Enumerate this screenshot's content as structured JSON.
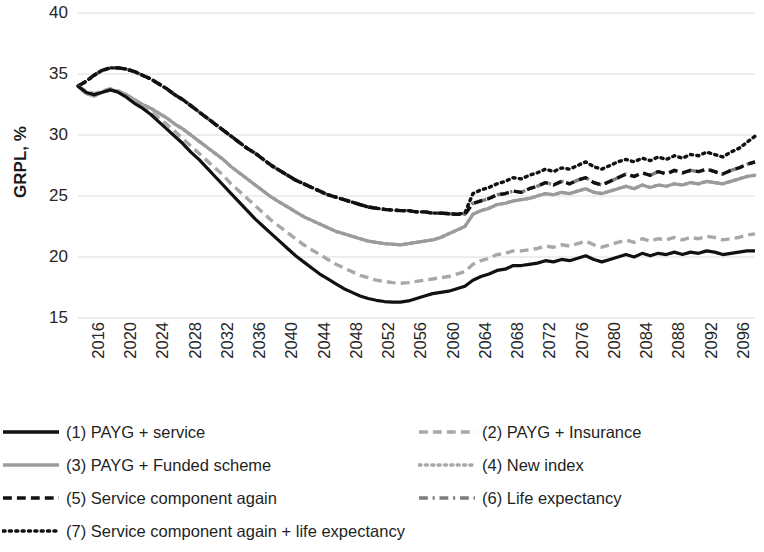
{
  "chart": {
    "type": "line",
    "ylabel": "GRPL, %",
    "xlabel": ""
  },
  "axis": {
    "y_ticks": [
      "40",
      "35",
      "30",
      "25",
      "20",
      "15"
    ],
    "x_ticks": [
      "2016",
      "2020",
      "2024",
      "2028",
      "2032",
      "2036",
      "2040",
      "2044",
      "2048",
      "2052",
      "2056",
      "2060",
      "2064",
      "2068",
      "2072",
      "2076",
      "2080",
      "2084",
      "2088",
      "2092",
      "2096",
      "2100"
    ]
  },
  "legend": {
    "items": [
      {
        "id": "series-1",
        "label": "(1) PAYG + service",
        "style": "solid",
        "color": "#111111",
        "width": 3.4,
        "column": "left",
        "row": 0
      },
      {
        "id": "series-3",
        "label": "(3) PAYG + Funded scheme",
        "style": "solid",
        "color": "#9b9b9b",
        "width": 3.4,
        "column": "left",
        "row": 1
      },
      {
        "id": "series-5",
        "label": "(5) Service component again",
        "style": "dash",
        "color": "#111111",
        "width": 3.4,
        "column": "left",
        "row": 2
      },
      {
        "id": "series-7",
        "label": "(7) Service component again + life expectancy",
        "style": "dot",
        "color": "#111111",
        "width": 3.4,
        "column": "left",
        "row": 3
      },
      {
        "id": "series-2",
        "label": "(2) PAYG + Insurance",
        "style": "dash",
        "color": "#a8a8a8",
        "width": 3.4,
        "column": "right",
        "row": 0
      },
      {
        "id": "series-4",
        "label": "(4) New index",
        "style": "dot",
        "color": "#a8a8a8",
        "width": 3.4,
        "column": "right",
        "row": 1
      },
      {
        "id": "series-6",
        "label": "(6) Life expectancy",
        "style": "dashdot",
        "color": "#7d7d7d",
        "width": 3.4,
        "column": "right",
        "row": 2
      }
    ]
  },
  "chart_data": {
    "type": "line",
    "title": "",
    "xlabel": "",
    "ylabel": "GRPL, %",
    "ylim": [
      15,
      40
    ],
    "xlim": [
      2016,
      2100
    ],
    "grid": true,
    "legend_position": "bottom",
    "x": [
      2016,
      2017,
      2018,
      2019,
      2020,
      2021,
      2022,
      2023,
      2024,
      2025,
      2026,
      2027,
      2028,
      2029,
      2030,
      2031,
      2032,
      2033,
      2034,
      2035,
      2036,
      2037,
      2038,
      2039,
      2040,
      2041,
      2042,
      2043,
      2044,
      2045,
      2046,
      2047,
      2048,
      2049,
      2050,
      2051,
      2052,
      2053,
      2054,
      2055,
      2056,
      2057,
      2058,
      2059,
      2060,
      2061,
      2062,
      2063,
      2064,
      2065,
      2066,
      2067,
      2068,
      2069,
      2070,
      2071,
      2072,
      2073,
      2074,
      2075,
      2076,
      2077,
      2078,
      2079,
      2080,
      2081,
      2082,
      2083,
      2084,
      2085,
      2086,
      2087,
      2088,
      2089,
      2090,
      2091,
      2092,
      2093,
      2094,
      2095,
      2096,
      2097,
      2098,
      2099,
      2100
    ],
    "series": [
      {
        "name": "(1) PAYG + service",
        "style": "solid",
        "color": "#111111",
        "values": [
          34.0,
          33.5,
          33.3,
          33.5,
          33.7,
          33.5,
          33.1,
          32.6,
          32.2,
          31.7,
          31.1,
          30.5,
          29.9,
          29.3,
          28.6,
          28.0,
          27.3,
          26.6,
          25.9,
          25.2,
          24.5,
          23.8,
          23.1,
          22.5,
          21.9,
          21.3,
          20.7,
          20.1,
          19.6,
          19.1,
          18.6,
          18.2,
          17.8,
          17.4,
          17.1,
          16.8,
          16.6,
          16.45,
          16.35,
          16.3,
          16.3,
          16.4,
          16.6,
          16.8,
          17.0,
          17.1,
          17.2,
          17.4,
          17.6,
          18.1,
          18.4,
          18.6,
          18.9,
          19.0,
          19.3,
          19.3,
          19.4,
          19.5,
          19.7,
          19.6,
          19.8,
          19.7,
          19.9,
          20.1,
          19.8,
          19.6,
          19.8,
          20.0,
          20.2,
          20.0,
          20.3,
          20.1,
          20.3,
          20.2,
          20.4,
          20.2,
          20.4,
          20.3,
          20.5,
          20.4,
          20.2,
          20.3,
          20.4,
          20.5,
          20.5
        ]
      },
      {
        "name": "(2) PAYG + Insurance",
        "style": "dash",
        "color": "#a8a8a8",
        "values": [
          34.0,
          33.6,
          33.4,
          33.6,
          33.8,
          33.6,
          33.2,
          32.8,
          32.4,
          31.9,
          31.4,
          30.9,
          30.3,
          29.7,
          29.1,
          28.5,
          27.9,
          27.3,
          26.7,
          26.0,
          25.4,
          24.8,
          24.2,
          23.6,
          23.0,
          22.5,
          22.0,
          21.5,
          21.0,
          20.6,
          20.2,
          19.8,
          19.4,
          19.1,
          18.8,
          18.5,
          18.3,
          18.1,
          18.0,
          17.9,
          17.85,
          17.9,
          18.0,
          18.1,
          18.2,
          18.3,
          18.4,
          18.6,
          18.8,
          19.4,
          19.7,
          19.9,
          20.2,
          20.3,
          20.5,
          20.5,
          20.6,
          20.7,
          20.9,
          20.8,
          21.0,
          20.9,
          21.1,
          21.3,
          21.0,
          20.8,
          21.0,
          21.2,
          21.4,
          21.2,
          21.5,
          21.3,
          21.5,
          21.4,
          21.6,
          21.4,
          21.6,
          21.5,
          21.7,
          21.6,
          21.4,
          21.5,
          21.6,
          21.8,
          21.9
        ]
      },
      {
        "name": "(3) PAYG + Funded scheme",
        "style": "solid",
        "color": "#9b9b9b",
        "values": [
          34.0,
          33.4,
          33.2,
          33.5,
          33.7,
          33.6,
          33.3,
          32.9,
          32.5,
          32.2,
          31.8,
          31.4,
          30.9,
          30.5,
          30.0,
          29.5,
          29.0,
          28.5,
          28.0,
          27.4,
          26.9,
          26.4,
          25.9,
          25.4,
          24.9,
          24.5,
          24.1,
          23.7,
          23.3,
          23.0,
          22.7,
          22.4,
          22.1,
          21.9,
          21.7,
          21.5,
          21.3,
          21.2,
          21.1,
          21.05,
          21.0,
          21.1,
          21.2,
          21.3,
          21.4,
          21.6,
          21.9,
          22.2,
          22.5,
          23.5,
          23.8,
          24.0,
          24.3,
          24.4,
          24.6,
          24.7,
          24.8,
          25.0,
          25.2,
          25.1,
          25.3,
          25.2,
          25.4,
          25.6,
          25.3,
          25.2,
          25.4,
          25.6,
          25.8,
          25.6,
          25.9,
          25.7,
          25.9,
          25.8,
          26.0,
          25.9,
          26.1,
          26.0,
          26.2,
          26.1,
          26.0,
          26.2,
          26.4,
          26.6,
          26.7
        ]
      },
      {
        "name": "(4) New index",
        "style": "dot",
        "color": "#a8a8a8",
        "values": [
          34.0,
          33.4,
          33.2,
          33.5,
          33.7,
          33.6,
          33.3,
          32.9,
          32.5,
          32.2,
          31.8,
          31.4,
          30.9,
          30.5,
          30.0,
          29.5,
          29.0,
          28.5,
          28.0,
          27.4,
          26.9,
          26.4,
          25.9,
          25.4,
          24.9,
          24.5,
          24.1,
          23.7,
          23.3,
          23.0,
          22.7,
          22.4,
          22.1,
          21.9,
          21.7,
          21.5,
          21.3,
          21.2,
          21.1,
          21.05,
          21.0,
          21.1,
          21.2,
          21.3,
          21.4,
          21.6,
          21.9,
          22.2,
          22.5,
          23.5,
          23.8,
          24.0,
          24.3,
          24.4,
          24.6,
          24.7,
          24.8,
          25.0,
          25.2,
          25.1,
          25.3,
          25.2,
          25.4,
          25.6,
          25.3,
          25.2,
          25.4,
          25.6,
          25.8,
          25.6,
          25.9,
          25.7,
          25.9,
          25.8,
          26.0,
          25.9,
          26.1,
          26.0,
          26.2,
          26.1,
          26.0,
          26.2,
          26.4,
          26.6,
          26.7
        ]
      },
      {
        "name": "(5) Service component again",
        "style": "dash",
        "color": "#111111",
        "values": [
          34.0,
          34.4,
          34.9,
          35.3,
          35.5,
          35.5,
          35.4,
          35.2,
          34.9,
          34.6,
          34.2,
          33.8,
          33.3,
          32.9,
          32.4,
          31.9,
          31.4,
          30.9,
          30.4,
          29.9,
          29.4,
          28.9,
          28.5,
          28.0,
          27.5,
          27.1,
          26.7,
          26.3,
          26.0,
          25.7,
          25.4,
          25.1,
          24.9,
          24.7,
          24.5,
          24.3,
          24.1,
          24.0,
          23.9,
          23.85,
          23.8,
          23.8,
          23.7,
          23.7,
          23.6,
          23.6,
          23.55,
          23.5,
          23.5,
          24.4,
          24.6,
          24.8,
          25.1,
          25.2,
          25.4,
          25.3,
          25.6,
          25.8,
          26.1,
          25.9,
          26.2,
          26.0,
          26.3,
          26.5,
          26.1,
          25.9,
          26.2,
          26.5,
          26.8,
          26.6,
          26.9,
          26.7,
          27.0,
          26.8,
          27.1,
          26.9,
          27.1,
          27.0,
          27.2,
          27.0,
          26.8,
          27.1,
          27.3,
          27.6,
          27.8
        ]
      },
      {
        "name": "(6) Life expectancy",
        "style": "dashdot",
        "color": "#7d7d7d",
        "values": [
          34.0,
          34.4,
          34.9,
          35.3,
          35.5,
          35.5,
          35.4,
          35.2,
          34.9,
          34.6,
          34.2,
          33.8,
          33.3,
          32.9,
          32.4,
          31.9,
          31.4,
          30.9,
          30.4,
          29.9,
          29.4,
          28.9,
          28.5,
          28.0,
          27.5,
          27.1,
          26.7,
          26.3,
          26.0,
          25.7,
          25.4,
          25.1,
          24.9,
          24.7,
          24.5,
          24.3,
          24.1,
          24.0,
          23.9,
          23.85,
          23.8,
          23.8,
          23.7,
          23.7,
          23.6,
          23.6,
          23.55,
          23.5,
          23.5,
          24.4,
          24.6,
          24.8,
          25.1,
          25.2,
          25.4,
          25.3,
          25.6,
          25.8,
          26.1,
          25.9,
          26.2,
          26.0,
          26.3,
          26.5,
          26.1,
          25.9,
          26.2,
          26.5,
          26.8,
          26.6,
          26.9,
          26.7,
          27.0,
          26.8,
          27.1,
          26.9,
          27.1,
          27.0,
          27.2,
          27.0,
          26.8,
          27.1,
          27.3,
          27.6,
          27.8
        ]
      },
      {
        "name": "(7) Service component again + life expectancy",
        "style": "dot",
        "color": "#111111",
        "values": [
          34.0,
          34.4,
          34.9,
          35.3,
          35.5,
          35.5,
          35.4,
          35.2,
          34.9,
          34.6,
          34.2,
          33.8,
          33.3,
          32.9,
          32.4,
          31.9,
          31.4,
          30.9,
          30.4,
          29.9,
          29.4,
          28.9,
          28.5,
          28.0,
          27.5,
          27.1,
          26.7,
          26.3,
          26.0,
          25.7,
          25.4,
          25.1,
          24.9,
          24.7,
          24.5,
          24.3,
          24.1,
          24.0,
          23.9,
          23.85,
          23.8,
          23.8,
          23.7,
          23.7,
          23.6,
          23.6,
          23.55,
          23.5,
          23.6,
          25.2,
          25.5,
          25.7,
          26.0,
          26.2,
          26.5,
          26.4,
          26.7,
          26.9,
          27.2,
          27.0,
          27.3,
          27.2,
          27.5,
          27.8,
          27.4,
          27.2,
          27.5,
          27.8,
          28.0,
          27.8,
          28.1,
          27.9,
          28.2,
          28.0,
          28.3,
          28.1,
          28.4,
          28.3,
          28.6,
          28.4,
          28.2,
          28.6,
          28.9,
          29.4,
          29.9
        ]
      }
    ]
  }
}
